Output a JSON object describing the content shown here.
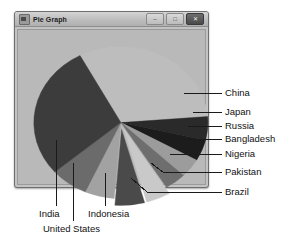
{
  "window": {
    "title": "Pie Graph",
    "icon": "chart-icon",
    "buttons": [
      {
        "name": "minimize",
        "glyph": "–"
      },
      {
        "name": "maximize",
        "glyph": "□"
      },
      {
        "name": "close",
        "glyph": "✕"
      }
    ]
  },
  "colors": {
    "panel_bg": "#b9b9b9",
    "window_bg": "#c3c3c3",
    "titlebar": "#c6c6c6",
    "leader_line": "#1a1a1a",
    "label_text": "#111111"
  },
  "chart_data": {
    "type": "pie",
    "title": "Pie Graph",
    "xlabel": "",
    "ylabel": "",
    "grid": false,
    "legend_position": "callout-labels",
    "start_angle_deg": -118,
    "direction": "clockwise",
    "categories": [
      "China",
      "Japan",
      "Russia",
      "Bangladesh",
      "Nigeria",
      "Pakistan",
      "Brazil",
      "Indonesia",
      "United States",
      "India"
    ],
    "values": [
      31.5,
      5.0,
      4.5,
      4.0,
      4.0,
      4.5,
      5.5,
      5.5,
      7.0,
      28.5
    ],
    "slices": [
      {
        "label": "China",
        "value": 31.5,
        "color": "#bdbdbd",
        "exploded": false,
        "label_side": "right"
      },
      {
        "label": "Japan",
        "value": 5.0,
        "color": "#2a2a2a",
        "exploded": false,
        "label_side": "right"
      },
      {
        "label": "Russia",
        "value": 4.5,
        "color": "#1c1c1c",
        "exploded": false,
        "label_side": "right"
      },
      {
        "label": "Bangladesh",
        "value": 4.0,
        "color": "#9c9c9c",
        "exploded": false,
        "label_side": "right"
      },
      {
        "label": "Nigeria",
        "value": 4.0,
        "color": "#6e6e6e",
        "exploded": false,
        "label_side": "right"
      },
      {
        "label": "Pakistan",
        "value": 4.5,
        "color": "#c9c9c9",
        "exploded": true,
        "label_side": "right"
      },
      {
        "label": "Brazil",
        "value": 5.5,
        "color": "#4a4a4a",
        "exploded": true,
        "label_side": "right"
      },
      {
        "label": "Indonesia",
        "value": 5.5,
        "color": "#a2a2a2",
        "exploded": false,
        "label_side": "bottom"
      },
      {
        "label": "United States",
        "value": 7.0,
        "color": "#6b6b6b",
        "exploded": false,
        "label_side": "bottom"
      },
      {
        "label": "India",
        "value": 28.5,
        "color": "#3c3c3c",
        "exploded": false,
        "label_side": "bottom"
      }
    ]
  },
  "labels": {
    "china": "China",
    "japan": "Japan",
    "russia": "Russia",
    "bangladesh": "Bangladesh",
    "nigeria": "Nigeria",
    "pakistan": "Pakistan",
    "brazil": "Brazil",
    "india": "India",
    "united_states": "United States",
    "indonesia": "Indonesia"
  }
}
